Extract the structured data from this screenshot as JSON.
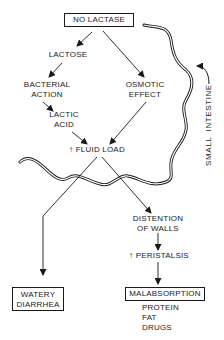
{
  "diagram": {
    "title_box": "NO LACTASE",
    "nodes": {
      "lactose": "LACTOSE",
      "bacterial_action": [
        "BACTERIAL",
        "ACTION"
      ],
      "lactic_acid": [
        "LACTIC",
        "ACID"
      ],
      "osmotic_effect": [
        "OSMOTIC",
        "EFFECT"
      ],
      "fluid_load": "FLUID LOAD",
      "fluid_load_prefix": "↑",
      "distention": [
        "DISTENTION",
        "OF WALLS"
      ],
      "peristalsis": "PERISTALSIS",
      "peristalsis_prefix": "↑"
    },
    "outcomes": {
      "watery_diarrhea": [
        "WATERY",
        "DIARRHEA"
      ],
      "malabsorption": "MALABSORPTION",
      "malabsorption_items": [
        "PROTEIN",
        "FAT",
        "DRUGS"
      ]
    },
    "intestine_label": "SMALL  INTESTINE",
    "edges": [
      {
        "from": "NO LACTASE",
        "to": "LACTOSE"
      },
      {
        "from": "NO LACTASE",
        "to": "OSMOTIC EFFECT"
      },
      {
        "from": "LACTOSE",
        "to": "BACTERIAL ACTION"
      },
      {
        "from": "BACTERIAL ACTION",
        "to": "LACTIC ACID"
      },
      {
        "from": "LACTIC ACID",
        "to": "FLUID LOAD"
      },
      {
        "from": "OSMOTIC EFFECT",
        "to": "FLUID LOAD"
      },
      {
        "from": "FLUID LOAD",
        "to": "WATERY DIARRHEA"
      },
      {
        "from": "FLUID LOAD",
        "to": "DISTENTION OF WALLS"
      },
      {
        "from": "DISTENTION OF WALLS",
        "to": "PERISTALSIS"
      },
      {
        "from": "PERISTALSIS",
        "to": "MALABSORPTION"
      }
    ],
    "colors": {
      "ink": "#1a1a1a",
      "background": "#ffffff"
    }
  }
}
